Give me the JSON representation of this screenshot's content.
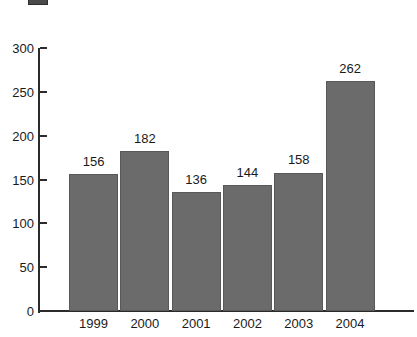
{
  "legend": {
    "swatch_name": "legend-color-swatch",
    "swatch_color": "#4a4a4a",
    "label": "",
    "secondary_label": ""
  },
  "axis": {
    "y_ticks": [
      "0",
      "50",
      "100",
      "150",
      "200",
      "250",
      "300"
    ],
    "x_labels": [
      "1999",
      "2000",
      "2001",
      "2002",
      "2003",
      "2004"
    ]
  },
  "bar_labels": [
    "156",
    "182",
    "136",
    "144",
    "158",
    "262"
  ],
  "colors": {
    "bar_fill": "#6b6b6b",
    "bar_stroke": "#595959",
    "axis": "#2b2b2b",
    "text": "#1a1a1a",
    "background": "#ffffff"
  },
  "chart_data": {
    "type": "bar",
    "title": "",
    "subtitle": "",
    "xlabel": "",
    "ylabel": "",
    "categories": [
      "1999",
      "2000",
      "2001",
      "2002",
      "2003",
      "2004"
    ],
    "values": [
      156,
      182,
      136,
      144,
      158,
      262
    ],
    "data_labels": [
      156,
      182,
      136,
      144,
      158,
      262
    ],
    "series": [
      {
        "name": "",
        "values": [
          156,
          182,
          136,
          144,
          158,
          262
        ],
        "color": "#6b6b6b"
      }
    ],
    "ylim": [
      0,
      300
    ],
    "ytick_values": [
      0,
      50,
      100,
      150,
      200,
      250,
      300
    ],
    "ytick_step": 50,
    "grid": false,
    "legend_position": "top-left",
    "bars_adjacent": true,
    "data_labels_position": "above-bar"
  }
}
